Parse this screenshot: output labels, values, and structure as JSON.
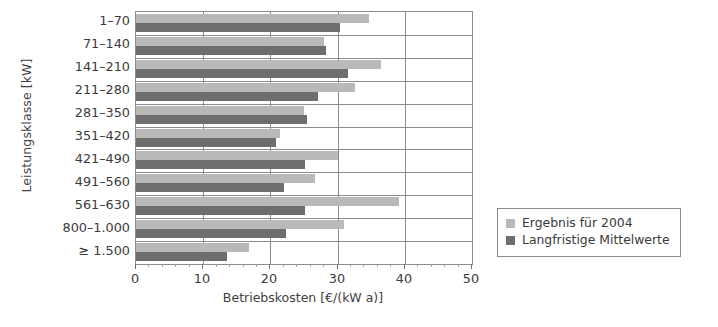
{
  "chart_data": {
    "type": "bar",
    "orientation": "horizontal",
    "title": "",
    "xlabel": "Betriebskosten [€/(kW a)]",
    "ylabel": "Leistungsklasse [kW]",
    "xlim": [
      0,
      50
    ],
    "xticks": [
      0,
      10,
      20,
      30,
      40,
      50
    ],
    "xtick_labels": [
      "0",
      "10",
      "20",
      "30",
      "40",
      "50"
    ],
    "grid": true,
    "legend_position": "right",
    "categories": [
      "1–70",
      "71–140",
      "141–210",
      "211–280",
      "281–350",
      "351–420",
      "421–490",
      "491–560",
      "561–630",
      "800–1.000",
      "≥ 1.500"
    ],
    "series": [
      {
        "name": "Ergebnis für 2004",
        "color": "#b9b9b9",
        "values": [
          34.7,
          28.0,
          36.5,
          32.6,
          25.0,
          21.4,
          30.0,
          26.7,
          39.1,
          31.0,
          16.8
        ]
      },
      {
        "name": "Langfristige Mittelwerte",
        "color": "#6e6e6e",
        "values": [
          30.4,
          28.2,
          31.6,
          27.1,
          25.4,
          20.9,
          25.2,
          22.0,
          25.1,
          22.3,
          13.6
        ]
      }
    ]
  },
  "legend": {
    "items": [
      {
        "label": "Ergebnis für 2004",
        "swatch": "light"
      },
      {
        "label": "Langfristige Mittelwerte",
        "swatch": "dark"
      }
    ]
  }
}
